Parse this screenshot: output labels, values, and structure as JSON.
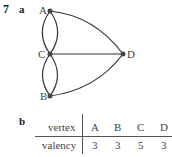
{
  "question": {
    "number": "7",
    "part_a_label": "a",
    "part_b_label": "b"
  },
  "graph": {
    "vertices": [
      {
        "name": "A",
        "x": 50,
        "y": 11
      },
      {
        "name": "C",
        "x": 50,
        "y": 54
      },
      {
        "name": "D",
        "x": 123,
        "y": 54
      },
      {
        "name": "B",
        "x": 50,
        "y": 96
      }
    ],
    "edges": [
      {
        "from": "A",
        "to": "C",
        "kind": "curve-left"
      },
      {
        "from": "A",
        "to": "C",
        "kind": "curve-right"
      },
      {
        "from": "C",
        "to": "B",
        "kind": "curve-left"
      },
      {
        "from": "C",
        "to": "B",
        "kind": "curve-right"
      },
      {
        "from": "A",
        "to": "D",
        "kind": "arc"
      },
      {
        "from": "C",
        "to": "D",
        "kind": "straight"
      },
      {
        "from": "B",
        "to": "D",
        "kind": "arc"
      }
    ],
    "colors": {
      "edge": "#333333",
      "vertex": "#444444"
    }
  },
  "table": {
    "row_headers": [
      "vertex",
      "valency"
    ],
    "columns": [
      "A",
      "B",
      "C",
      "D"
    ],
    "values": [
      "3",
      "3",
      "5",
      "3"
    ]
  }
}
